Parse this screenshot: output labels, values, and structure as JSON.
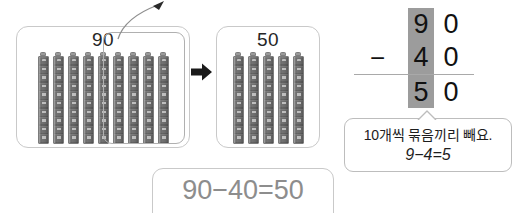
{
  "left_group": {
    "label": "90",
    "tower_count": 9,
    "grouped_tower_count": 4,
    "grouped_label": "removed-group"
  },
  "right_group": {
    "label": "50",
    "tower_count": 5
  },
  "arrows": {
    "transition": "right-arrow",
    "curved": "curved-up-right-arrow"
  },
  "vertical_subtraction": {
    "operator": "−",
    "minuend": {
      "tens": "9",
      "ones": "0"
    },
    "subtrahend": {
      "tens": "4",
      "ones": "0"
    },
    "difference": {
      "tens": "5",
      "ones": "0"
    },
    "highlight_color": "#9c9c9c"
  },
  "callout": {
    "line1": "10개씩 묶음끼리 빼요.",
    "line2": "9−4=5"
  },
  "equation": {
    "text": "90−40=50",
    "color": "#8d8d8d"
  }
}
